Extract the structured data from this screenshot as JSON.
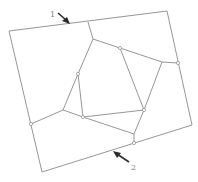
{
  "diagram": {
    "type": "mesh-partition",
    "colors": {
      "edge": "#8a8a8a",
      "arrow": "#2a2a2a",
      "label": "#7a7a7a"
    },
    "outer_boundary": [
      [
        9,
        31
      ],
      [
        167,
        11
      ],
      [
        192,
        125
      ],
      [
        42,
        172
      ]
    ],
    "inner_polygon": [
      [
        93,
        39
      ],
      [
        120,
        48
      ],
      [
        144,
        110
      ],
      [
        83,
        117
      ],
      [
        78,
        74
      ]
    ],
    "spokes": [
      [
        [
          88,
          22
        ],
        [
          93,
          39
        ]
      ],
      [
        [
          120,
          48
        ],
        [
          162,
          62
        ]
      ],
      [
        [
          162,
          62
        ],
        [
          178,
          63
        ]
      ],
      [
        [
          162,
          62
        ],
        [
          144,
          110
        ]
      ],
      [
        [
          144,
          110
        ],
        [
          134,
          134
        ]
      ],
      [
        [
          134,
          134
        ],
        [
          134,
          143
        ]
      ],
      [
        [
          83,
          117
        ],
        [
          134,
          134
        ]
      ],
      [
        [
          83,
          117
        ],
        [
          63,
          110
        ]
      ],
      [
        [
          63,
          110
        ],
        [
          31,
          124
        ]
      ],
      [
        [
          63,
          110
        ],
        [
          78,
          74
        ]
      ],
      [
        [
          93,
          39
        ],
        [
          78,
          74
        ]
      ]
    ],
    "nodes": [
      [
        120,
        48
      ],
      [
        78,
        74
      ],
      [
        178,
        63
      ],
      [
        144,
        110
      ],
      [
        83,
        117
      ],
      [
        31,
        124
      ],
      [
        134,
        143
      ]
    ],
    "annotations": [
      {
        "label": "1",
        "text_pos": [
          52,
          14
        ],
        "arrow_from": [
          58,
          13
        ],
        "arrow_to": [
          69,
          23
        ]
      },
      {
        "label": "2",
        "text_pos": [
          132,
          168
        ],
        "arrow_from": [
          129,
          162
        ],
        "arrow_to": [
          114,
          152
        ]
      }
    ]
  }
}
